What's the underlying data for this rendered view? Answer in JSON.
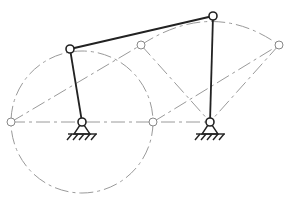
{
  "diagram": {
    "type": "four-bar-linkage",
    "points": {
      "O1": [
        82,
        122
      ],
      "O2": [
        210,
        122
      ],
      "A": [
        70,
        49
      ],
      "B": [
        213,
        16
      ],
      "A_left": [
        11,
        122
      ],
      "A_right": [
        153,
        122
      ],
      "C1": [
        141,
        45
      ],
      "C2": [
        279,
        45
      ]
    },
    "crank_circle": {
      "cx": 82,
      "cy": 122,
      "r": 71
    },
    "colors": {
      "link": "#222222",
      "construction": "#9a9a9a"
    }
  }
}
